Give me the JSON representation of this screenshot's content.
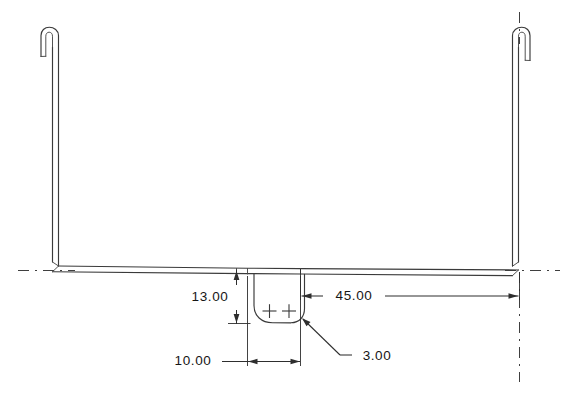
{
  "drawing": {
    "type": "engineering-part-drawing",
    "title": "Hooked U-Channel Bracket Elevation View",
    "background_color": "#ffffff",
    "line_color": "#3a3a3a",
    "dimension_color": "#2e2e2e",
    "units_note": "",
    "view": "front elevation",
    "geometry": {
      "shape": "U-shaped channel with two upright legs, each terminating in a narrow 180-degree hook bend; a rounded rectangular tab with two hole centers projects downward from the lower horizontal web",
      "left_leg": {
        "name": "left-upright-leg",
        "hook_direction": "left",
        "top_y": 30,
        "bottom_y": 268
      },
      "right_leg": {
        "name": "right-upright-leg",
        "hook_direction": "right",
        "top_y": 30,
        "bottom_y": 268
      },
      "bottom_web": {
        "name": "bottom-horizontal-web",
        "y": 268,
        "thickness_px": 6
      },
      "center_tab": {
        "name": "center-tab-with-holes",
        "hole_count": 2,
        "corner_style": "filleted"
      }
    },
    "centerlines": [
      {
        "name": "left-horizontal-centerline",
        "orientation": "horizontal"
      },
      {
        "name": "right-horizontal-centerline",
        "orientation": "horizontal"
      },
      {
        "name": "right-vertical-centerline",
        "orientation": "vertical"
      },
      {
        "name": "right-hook-vertical-centerline",
        "orientation": "vertical"
      }
    ],
    "dimensions": [
      {
        "id": "dim-13",
        "value": "13.00",
        "orientation": "vertical",
        "description": "Depth of the center tab measured down from the underside of the bottom web",
        "arrow_style": "double-arrow-inside"
      },
      {
        "id": "dim-45",
        "value": "45.00",
        "orientation": "horizontal",
        "description": "Distance from the right edge of the center tab to the right leg centerline",
        "arrow_style": "double-arrow-inside"
      },
      {
        "id": "dim-10",
        "value": "10.00",
        "orientation": "horizontal",
        "description": "Width of the center tab between the two hole-center extension lines",
        "arrow_style": "double-arrow-inside"
      },
      {
        "id": "dim-3",
        "value": "3.00",
        "orientation": "leader",
        "description": "Corner fillet radius on the bottom right of the center tab",
        "arrow_style": "leader-with-arrow"
      }
    ],
    "hole_marks": [
      {
        "name": "hole-center-mark-left",
        "symbol": "+"
      },
      {
        "name": "hole-center-mark-right",
        "symbol": "+"
      }
    ]
  }
}
